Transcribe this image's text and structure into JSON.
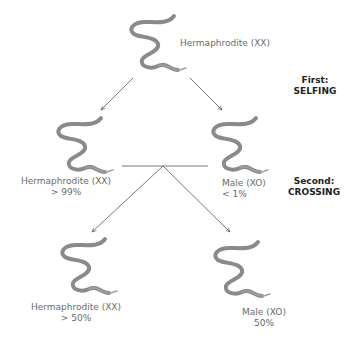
{
  "stages": {
    "first": {
      "line1": "First:",
      "line2": "SELFING"
    },
    "second": {
      "line1": "Second:",
      "line2": "CROSSING"
    }
  },
  "nodes": {
    "parent": {
      "label": "Hermaphrodite (XX)"
    },
    "self_herm": {
      "label": "Hermaphrodite (XX)",
      "pct": "> 99%"
    },
    "self_male": {
      "label": "Male (XO)",
      "pct": "< 1%"
    },
    "cross_herm": {
      "label": "Hermaphrodite (XX)",
      "pct": "> 50%"
    },
    "cross_male": {
      "label": "Male (XO)",
      "pct": "50%"
    }
  },
  "colors": {
    "worm": "#8a8a8a",
    "arrow": "#555555",
    "text": "#6a6a6a",
    "stage": "#222222"
  }
}
